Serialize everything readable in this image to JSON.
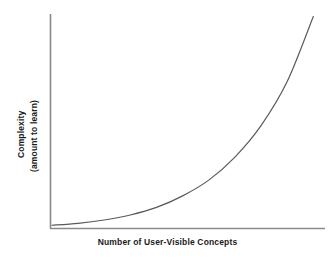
{
  "chart_data": {
    "type": "line",
    "title": "",
    "xlabel": "Number of User-Visible Concepts",
    "ylabel_line1": "Complexity",
    "ylabel_line2": "(amount to learn)",
    "ylabel": "Complexity (amount to learn)",
    "grid": false,
    "legend": "none",
    "xlim": [
      0,
      100
    ],
    "ylim": [
      0,
      100
    ],
    "xticks": [],
    "yticks": [],
    "series": [
      {
        "name": "complexity growth",
        "shape": "exponential",
        "color": "#5a5a5a",
        "linewidth": 1.2,
        "x": [
          0,
          10,
          20,
          30,
          40,
          50,
          60,
          70,
          80,
          90,
          100
        ],
        "y": [
          0.5,
          1.4,
          3.0,
          5.4,
          9.0,
          14.5,
          22.0,
          33.0,
          48.0,
          69.0,
          100.0
        ]
      }
    ],
    "annotations": [],
    "axis_color": "#8a8a8a"
  },
  "figure": {
    "background": "#ffffff",
    "text_color": "#1a1a1a"
  }
}
